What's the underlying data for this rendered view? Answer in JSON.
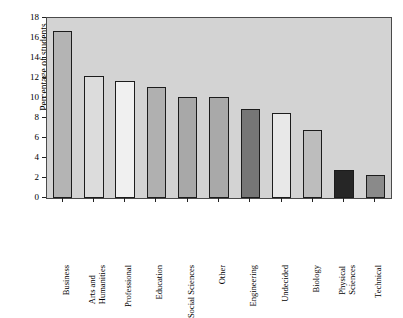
{
  "chart_data": {
    "type": "bar",
    "title": "",
    "xlabel": "",
    "ylabel": "Percentage of students",
    "ylim": [
      0,
      18
    ],
    "ytick_labels": [
      "0",
      "2",
      "4",
      "6",
      "8",
      "10",
      "12",
      "14",
      "16",
      "18"
    ],
    "ytick_values": [
      0,
      2,
      4,
      6,
      8,
      10,
      12,
      14,
      16,
      18
    ],
    "ystep": 2,
    "grid": false,
    "legend": "none",
    "plot_background": "#d3d3d3",
    "figure_background": "#ffffff",
    "bar_edge_color": "#1c1c1c",
    "categories": [
      "Business",
      "Arts and Humanities",
      "Professional",
      "Education",
      "Social Sciences",
      "Other",
      "Engineering",
      "Undecided",
      "Biology",
      "Physical Sciences",
      "Technical"
    ],
    "category_lines": [
      [
        "Business"
      ],
      [
        "Arts and",
        "Humanities"
      ],
      [
        "Professional"
      ],
      [
        "Education"
      ],
      [
        "Social Sciences"
      ],
      [
        "Other"
      ],
      [
        "Engineering"
      ],
      [
        "Undecided"
      ],
      [
        "Biology"
      ],
      [
        "Physical",
        "Sciences"
      ],
      [
        "Technical"
      ]
    ],
    "values": [
      16.7,
      12.2,
      11.7,
      11.15,
      10.15,
      10.1,
      8.9,
      8.55,
      6.8,
      2.85,
      2.35
    ],
    "bar_colors": [
      "#b4b4b4",
      "#dcdcdc",
      "#f0f0f0",
      "#b0b0b0",
      "#a8a8a8",
      "#a9a9a9",
      "#767676",
      "#e8e8e8",
      "#bdbdbd",
      "#262626",
      "#8a8a8a"
    ]
  }
}
